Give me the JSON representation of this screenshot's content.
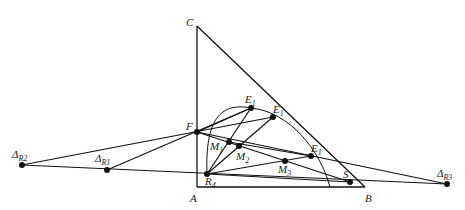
{
  "diagram": {
    "type": "geometric-construction",
    "points": {
      "C": {
        "label": "C",
        "x": 197,
        "y": 26
      },
      "A": {
        "label": "A",
        "x": 197,
        "y": 187
      },
      "B": {
        "label": "B",
        "x": 365,
        "y": 187
      },
      "F": {
        "label": "F",
        "x": 197,
        "y": 132
      },
      "E1a": {
        "label": "E",
        "sub": "1",
        "x": 251,
        "y": 108
      },
      "E1b": {
        "label": "E",
        "sub": "1",
        "x": 273,
        "y": 117
      },
      "E1c": {
        "label": "E",
        "sub": "1",
        "x": 311,
        "y": 156
      },
      "M1": {
        "label": "M",
        "sub": "1",
        "x": 229,
        "y": 142
      },
      "M2": {
        "label": "M",
        "sub": "2",
        "x": 239,
        "y": 146
      },
      "M3": {
        "label": "M",
        "sub": "3",
        "x": 285,
        "y": 161
      },
      "R4": {
        "label": "R",
        "sub": "4",
        "x": 207,
        "y": 174
      },
      "S": {
        "label": "S",
        "x": 350,
        "y": 182
      },
      "DR1": {
        "label": "Δ",
        "sub": "R1",
        "x": 107,
        "y": 170
      },
      "DR2": {
        "label": "Δ",
        "sub": "R2",
        "x": 22,
        "y": 165
      },
      "DR3": {
        "label": "Δ",
        "sub": "R3",
        "x": 447,
        "y": 184
      }
    }
  }
}
